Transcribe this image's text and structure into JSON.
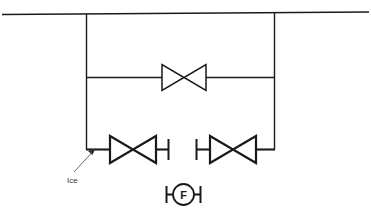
{
  "diagram": {
    "colors": {
      "line": "#1a1a1a",
      "background": "#ffffff",
      "leader": "#555555",
      "text": "#3a3a3a"
    },
    "header": {
      "name": "main-header-pipe"
    },
    "annotations": [
      {
        "id": "ice",
        "label": "Ice",
        "points_to": "left-elbow"
      }
    ],
    "valves": [
      {
        "id": "bypass-valve",
        "type": "gate-valve",
        "position": "middle-branch",
        "label": ""
      },
      {
        "id": "left-branch-valve",
        "type": "gate-valve",
        "position": "bottom-left-branch",
        "label": ""
      },
      {
        "id": "right-branch-valve",
        "type": "gate-valve",
        "position": "bottom-right-branch",
        "label": ""
      }
    ],
    "caps": [
      {
        "id": "left-branch-cap",
        "position": "bottom-left-branch-end"
      },
      {
        "id": "right-branch-cap",
        "position": "bottom-right-branch-start"
      },
      {
        "id": "flow-element-cap-left",
        "position": "flow-element-left"
      },
      {
        "id": "flow-element-cap-right",
        "position": "flow-element-right"
      }
    ],
    "instruments": [
      {
        "id": "flow-element",
        "tag": "F",
        "type": "flow-element-bubble"
      }
    ]
  }
}
